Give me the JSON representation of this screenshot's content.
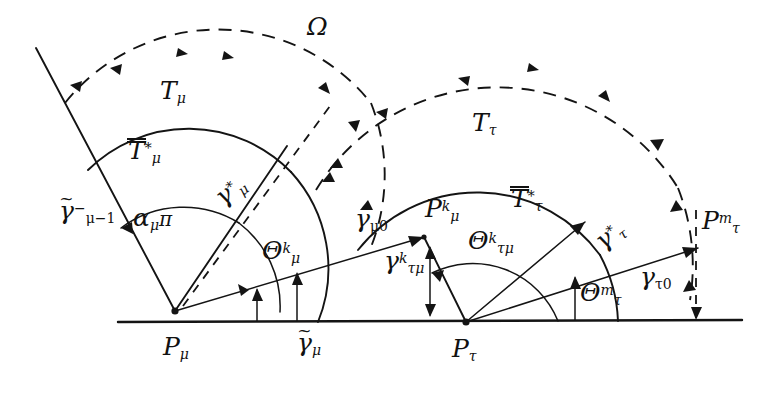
{
  "figure": {
    "title_symbol": "Ω",
    "vertices": [
      {
        "name": "P_mu",
        "base": "P",
        "sub": "μ",
        "sup": ""
      },
      {
        "name": "P_tau",
        "base": "P",
        "sub": "τ",
        "sup": ""
      }
    ],
    "labels": {
      "omega": {
        "text": "Ω"
      },
      "T_mu": {
        "base": "T",
        "sub": "μ",
        "sup": ""
      },
      "T_tau": {
        "base": "T",
        "sub": "τ",
        "sup": ""
      },
      "Tbar_mu": {
        "base": "T",
        "sub": "μ",
        "sup": "*",
        "bars": 2
      },
      "Tbar_tau": {
        "base": "T",
        "sub": "τ",
        "sup": "*",
        "bars": 2
      },
      "gamma_star_mu": {
        "base": "γ",
        "sub": "μ",
        "sup": "*"
      },
      "gamma_star_tau": {
        "base": "γ",
        "sub": "τ",
        "sup": "*"
      },
      "gamma_tilde_mu_minus_1": {
        "base": "γ",
        "sub": "μ−1",
        "sup": "−",
        "tilde": true
      },
      "gamma_tilde_mu": {
        "base": "γ",
        "sub": "μ",
        "sup": "",
        "tilde": true
      },
      "gamma_mu_0": {
        "base": "γ",
        "sub": "μ0",
        "sup": ""
      },
      "gamma_tau_0": {
        "base": "γ",
        "sub": "τ0",
        "sup": ""
      },
      "gamma_k_taumu": {
        "base": "γ",
        "sub": "τμ",
        "sup": "k"
      },
      "alpha_mu_pi": {
        "base": "α",
        "sub": "μ",
        "sup": "",
        "trail": "π"
      },
      "theta_k_mu": {
        "base": "Θ",
        "sub": "μ",
        "sup": "k"
      },
      "theta_k_taumu": {
        "base": "Θ",
        "sub": "τμ",
        "sup": "k"
      },
      "theta_m_tau": {
        "base": "Θ",
        "sub": "τ",
        "sup": "m"
      },
      "P_k_mu": {
        "base": "P",
        "sub": "μ",
        "sup": "k"
      },
      "P_m_tau": {
        "base": "P",
        "sub": "τ",
        "sup": "m"
      },
      "P_mu": {
        "base": "P",
        "sub": "μ",
        "sup": ""
      },
      "P_tau": {
        "base": "P",
        "sub": "τ",
        "sup": ""
      }
    },
    "colors": {
      "ink": "#141414",
      "background": "#ffffff"
    },
    "geometry": {
      "baseline_y": 322,
      "P_mu": [
        175,
        311
      ],
      "P_tau": [
        466,
        322
      ],
      "inner_arc_mu_radius": 143,
      "outer_arc_mu_radius": 196,
      "inner_arc_tau_radius": 152,
      "outer_arc_tau_radius": 212
    }
  }
}
